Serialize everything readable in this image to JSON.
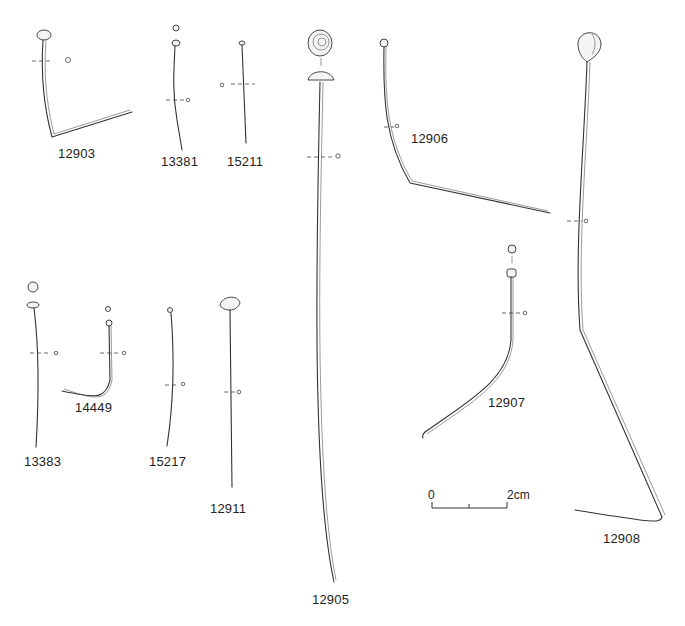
{
  "plate": {
    "title": "Pins",
    "items": [
      {
        "id": "12903",
        "label": "12903"
      },
      {
        "id": "13381",
        "label": "13381"
      },
      {
        "id": "15211",
        "label": "15211"
      },
      {
        "id": "12905",
        "label": "12905"
      },
      {
        "id": "12906",
        "label": "12906"
      },
      {
        "id": "12908",
        "label": "12908"
      },
      {
        "id": "13383",
        "label": "13383"
      },
      {
        "id": "14449",
        "label": "14449"
      },
      {
        "id": "15217",
        "label": "15217"
      },
      {
        "id": "12911",
        "label": "12911"
      },
      {
        "id": "12907",
        "label": "12907"
      }
    ],
    "scale_bar": {
      "start_label": "0",
      "end_label": "2cm"
    }
  },
  "colors": {
    "line": "#333333",
    "background": "#ffffff"
  }
}
